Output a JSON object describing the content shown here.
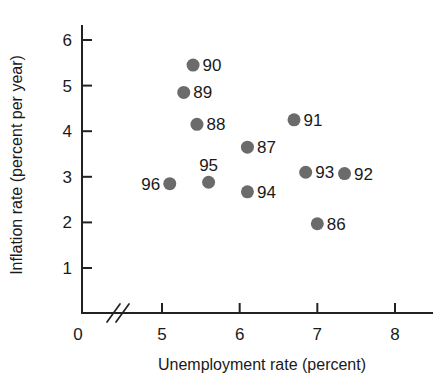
{
  "chart_data": {
    "type": "scatter",
    "title": "",
    "xlabel": "Unemployment rate (percent)",
    "ylabel": "Inflation rate (percent per year)",
    "xlim": [
      4.55,
      8.4
    ],
    "ylim": [
      0,
      6.45
    ],
    "grid": false,
    "legend": "none",
    "axis_break": {
      "axis": "x",
      "between": [
        0,
        5
      ],
      "symbol": "//"
    },
    "x_ticks": [
      "5",
      "6",
      "7",
      "8"
    ],
    "x_tick_values": [
      5,
      6,
      7,
      8
    ],
    "x_origin_label": "0",
    "y_ticks": [
      "1",
      "2",
      "3",
      "4",
      "5",
      "6"
    ],
    "y_tick_values": [
      1,
      2,
      3,
      4,
      5,
      6
    ],
    "marker_color": "#6b6b6b",
    "axis_color": "#222222",
    "points": [
      {
        "label": "86",
        "x": 7.0,
        "y": 1.97,
        "label_pos": "right"
      },
      {
        "label": "87",
        "x": 6.1,
        "y": 3.65,
        "label_pos": "right"
      },
      {
        "label": "88",
        "x": 5.45,
        "y": 4.15,
        "label_pos": "right"
      },
      {
        "label": "89",
        "x": 5.28,
        "y": 4.85,
        "label_pos": "right"
      },
      {
        "label": "90",
        "x": 5.4,
        "y": 5.45,
        "label_pos": "right"
      },
      {
        "label": "91",
        "x": 6.7,
        "y": 4.25,
        "label_pos": "right"
      },
      {
        "label": "92",
        "x": 7.35,
        "y": 3.07,
        "label_pos": "right"
      },
      {
        "label": "93",
        "x": 6.85,
        "y": 3.1,
        "label_pos": "right"
      },
      {
        "label": "94",
        "x": 6.1,
        "y": 2.67,
        "label_pos": "right"
      },
      {
        "label": "95",
        "x": 5.6,
        "y": 2.88,
        "label_pos": "above"
      },
      {
        "label": "96",
        "x": 5.1,
        "y": 2.85,
        "label_pos": "left"
      }
    ]
  }
}
